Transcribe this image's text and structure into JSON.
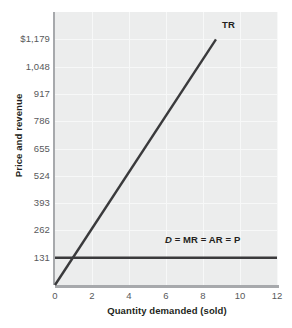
{
  "chart_data": {
    "type": "line",
    "title": "",
    "xlabel": "Quantity demanded (sold)",
    "ylabel": "Price and revenue",
    "xlim": [
      0,
      12
    ],
    "ylim": [
      0,
      1310
    ],
    "grid": true,
    "legend_position": "inline-annotations",
    "xticks": [
      "0",
      "2",
      "4",
      "6",
      "8",
      "10",
      "12"
    ],
    "xtick_values": [
      0,
      2,
      4,
      6,
      8,
      10,
      12
    ],
    "yticks": [
      "131",
      "262",
      "393",
      "524",
      "655",
      "786",
      "917",
      "1,048",
      "$1,179"
    ],
    "ytick_values": [
      131,
      262,
      393,
      524,
      655,
      786,
      917,
      1048,
      1179
    ],
    "series": [
      {
        "name": "TR",
        "label": "TR",
        "type": "line",
        "color": "#3a3a3c",
        "x": [
          0,
          8.7
        ],
        "values": [
          0,
          1179
        ],
        "slope": 135.5,
        "annotation": "TR"
      },
      {
        "name": "D = MR = AR = P",
        "label": "D = MR = AR = P",
        "type": "line",
        "color": "#3a3a3c",
        "x": [
          0,
          12
        ],
        "values": [
          131,
          131
        ],
        "annotation_symbol": "D",
        "annotation_rest": " = MR = AR = P"
      }
    ],
    "annotations": [
      {
        "text": "TR",
        "x": 8.9,
        "y": 1240
      },
      {
        "text": "D = MR = AR = P",
        "x": 6.0,
        "y": 205
      }
    ],
    "colors": {
      "plot_background": "#eceded",
      "gridline": "#f7f8f8",
      "axis_spine": "#a7a9ac",
      "line": "#3a3a3c",
      "tick_label": "#58595b",
      "axis_title": "#231f20",
      "page_background": "#ffffff"
    }
  }
}
